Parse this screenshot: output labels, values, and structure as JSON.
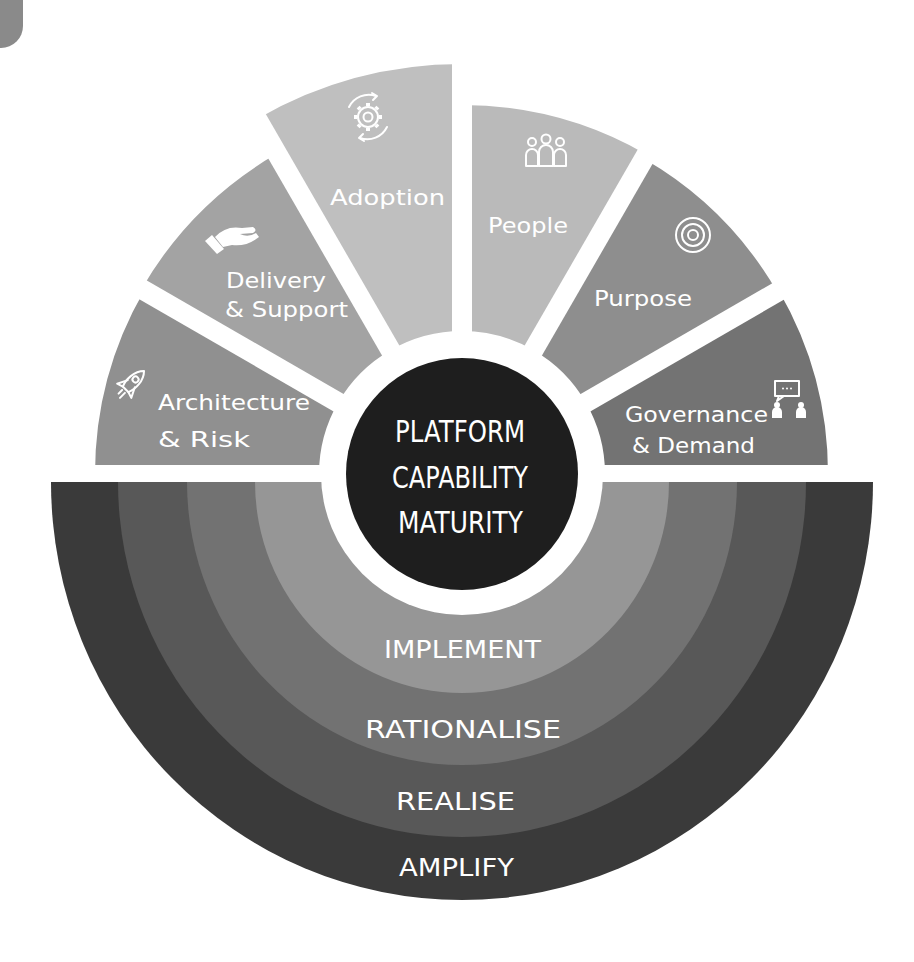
{
  "corner_tab": {
    "color": "#8a8a8a"
  },
  "diagram": {
    "title_lines": [
      "PLATFORM",
      "CAPABILITY",
      "MATURITY"
    ],
    "center_color": "#1e1e1e",
    "segments": [
      {
        "id": "architecture-risk",
        "lines": [
          "Architecture",
          "& Risk"
        ],
        "icon": "rocket-icon",
        "color": "#909090"
      },
      {
        "id": "delivery-support",
        "lines": [
          "Delivery",
          "& Support"
        ],
        "icon": "hand-icon",
        "color": "#a3a3a3"
      },
      {
        "id": "adoption",
        "lines": [
          "Adoption"
        ],
        "icon": "gear-cycle-icon",
        "color": "#bfbfbf"
      },
      {
        "id": "people",
        "lines": [
          "People"
        ],
        "icon": "people-icon",
        "color": "#bababa"
      },
      {
        "id": "purpose",
        "lines": [
          "Purpose"
        ],
        "icon": "target-icon",
        "color": "#8e8e8e"
      },
      {
        "id": "governance-demand",
        "lines": [
          "Governance",
          "& Demand"
        ],
        "icon": "meeting-icon",
        "color": "#737373"
      }
    ],
    "levels": [
      {
        "label": "IMPLEMENT",
        "color": "#969696"
      },
      {
        "label": "RATIONALISE",
        "color": "#727272"
      },
      {
        "label": "REALISE",
        "color": "#585858"
      },
      {
        "label": "AMPLIFY",
        "color": "#3a3a3a"
      }
    ]
  }
}
